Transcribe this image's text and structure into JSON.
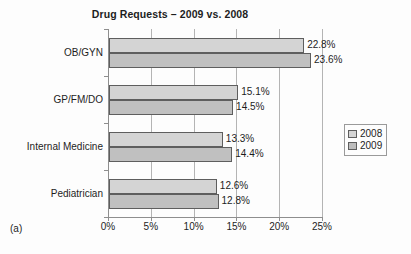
{
  "figure": {
    "panel_caption": "(a)"
  },
  "chart_data": {
    "type": "bar",
    "orientation": "horizontal",
    "title": "Drug Requests – 2009 vs. 2008",
    "xlabel": "",
    "ylabel": "",
    "categories": [
      "OB/GYN",
      "GP/FM/DO",
      "Internal Medicine",
      "Pediatrician"
    ],
    "series": [
      {
        "name": "2008",
        "values": [
          22.8,
          15.1,
          13.3,
          12.6
        ],
        "labels": [
          "22.8%",
          "15.1%",
          "13.3%",
          "12.6%"
        ],
        "color": "#d4d4d4"
      },
      {
        "name": "2009",
        "values": [
          23.6,
          14.5,
          14.4,
          12.8
        ],
        "labels": [
          "23.6%",
          "14.5%",
          "14.4%",
          "12.8%"
        ],
        "color": "#c0c0c0"
      }
    ],
    "xlim": [
      0,
      25
    ],
    "xticks": [
      0,
      5,
      10,
      15,
      20,
      25
    ],
    "xticklabels": [
      "0%",
      "5%",
      "10%",
      "15%",
      "20%",
      "25%"
    ],
    "grid": true,
    "grid_axis": "x",
    "legend": {
      "position": "right",
      "entries": [
        {
          "label": "2008",
          "color": "#d4d4d4"
        },
        {
          "label": "2009",
          "color": "#bdbdbd"
        }
      ]
    }
  }
}
